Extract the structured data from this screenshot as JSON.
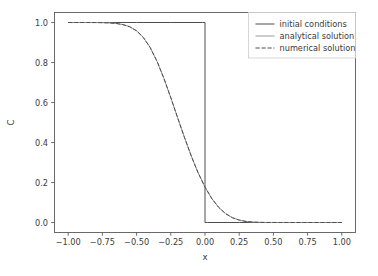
{
  "chart_data": {
    "type": "line",
    "title": "",
    "xlabel": "x",
    "ylabel": "C",
    "xlim": [
      -1.1,
      1.1
    ],
    "ylim": [
      -0.05,
      1.05
    ],
    "grid": false,
    "legend_position": "upper right",
    "xticks": [
      -1.0,
      -0.75,
      -0.5,
      -0.25,
      0.0,
      0.25,
      0.5,
      0.75,
      1.0
    ],
    "xticklabels": [
      "−1.00",
      "−0.75",
      "−0.50",
      "−0.25",
      "0.00",
      "0.25",
      "0.50",
      "0.75",
      "1.00"
    ],
    "yticks": [
      0.0,
      0.2,
      0.4,
      0.6,
      0.8,
      1.0
    ],
    "yticklabels": [
      "0.0",
      "0.2",
      "0.4",
      "0.6",
      "0.8",
      "1.0"
    ],
    "series": [
      {
        "name": "initial conditions",
        "style": "solid",
        "color": "#4d4d4d",
        "linewidth": 1.0,
        "x": [
          -1.0,
          -0.75,
          -0.5,
          -0.25,
          -0.02,
          0.0,
          0.0,
          0.02,
          0.25,
          0.5,
          0.75,
          1.0
        ],
        "y": [
          1.0,
          1.0,
          1.0,
          1.0,
          1.0,
          1.0,
          0.0,
          0.0,
          0.0,
          0.0,
          0.0,
          0.0
        ]
      },
      {
        "name": "analytical solution",
        "style": "solid",
        "color": "#9a9a9a",
        "linewidth": 1.0,
        "x": [
          -1.0,
          -0.95,
          -0.9,
          -0.85,
          -0.8,
          -0.75,
          -0.7,
          -0.65,
          -0.6,
          -0.55,
          -0.5,
          -0.45,
          -0.4,
          -0.35,
          -0.3,
          -0.25,
          -0.2,
          -0.15,
          -0.1,
          -0.05,
          0.0,
          0.05,
          0.1,
          0.15,
          0.2,
          0.25,
          0.3,
          0.35,
          0.4,
          0.45,
          0.5,
          0.55,
          0.6,
          0.65,
          0.7,
          0.75,
          0.8,
          0.85,
          0.9,
          0.95,
          1.0
        ],
        "y": [
          1.0,
          1.0,
          1.0,
          0.9999,
          0.9997,
          0.9992,
          0.998,
          0.9953,
          0.9896,
          0.9786,
          0.9583,
          0.9246,
          0.874,
          0.805,
          0.72,
          0.6241,
          0.5239,
          0.4251,
          0.3319,
          0.2481,
          0.1769,
          0.1195,
          0.0756,
          0.0445,
          0.0241,
          0.0119,
          0.0053,
          0.0021,
          0.0007,
          0.0002,
          0.0001,
          0.0,
          0.0,
          0.0,
          0.0,
          0.0,
          0.0,
          0.0,
          0.0,
          0.0,
          0.0
        ]
      },
      {
        "name": "numerical solution",
        "style": "dashed",
        "color": "#4d4d4d",
        "linewidth": 1.0,
        "x": [
          -1.0,
          -0.95,
          -0.9,
          -0.85,
          -0.8,
          -0.75,
          -0.7,
          -0.65,
          -0.6,
          -0.55,
          -0.5,
          -0.45,
          -0.4,
          -0.35,
          -0.3,
          -0.25,
          -0.2,
          -0.15,
          -0.1,
          -0.05,
          0.0,
          0.05,
          0.1,
          0.15,
          0.2,
          0.25,
          0.3,
          0.35,
          0.4,
          0.45,
          0.5,
          0.55,
          0.6,
          0.65,
          0.7,
          0.75,
          0.8,
          0.85,
          0.9,
          0.95,
          1.0
        ],
        "y": [
          1.0,
          1.0,
          1.0,
          0.9999,
          0.9997,
          0.9992,
          0.998,
          0.9953,
          0.9896,
          0.9786,
          0.9583,
          0.9246,
          0.874,
          0.805,
          0.72,
          0.6241,
          0.5239,
          0.4251,
          0.3319,
          0.2481,
          0.1769,
          0.1195,
          0.0756,
          0.0445,
          0.0241,
          0.0119,
          0.0053,
          0.0021,
          0.0007,
          0.0002,
          0.0001,
          0.0,
          0.0,
          0.0,
          0.0,
          0.0,
          0.0,
          0.0,
          0.0,
          0.0,
          0.0
        ]
      }
    ]
  },
  "axes": {
    "xlabel": "x",
    "ylabel": "C"
  },
  "legend": {
    "entries": [
      {
        "label": "initial conditions"
      },
      {
        "label": "analytical solution"
      },
      {
        "label": "numerical solution"
      }
    ]
  },
  "colors": {
    "initial": "#4d4d4d",
    "analytical": "#9a9a9a",
    "numerical": "#4d4d4d",
    "spine": "#5a5a5a",
    "text": "#3b3b3b",
    "background": "#ffffff"
  }
}
